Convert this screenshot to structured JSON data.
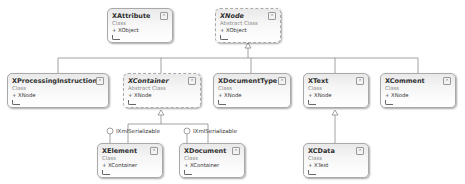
{
  "diagram": {
    "type": "class-diagram",
    "classes": [
      {
        "id": "xattribute",
        "name": "XAttribute",
        "kind": "Class",
        "base": "+ XObject",
        "abstract": false
      },
      {
        "id": "xnode",
        "name": "XNode",
        "kind": "Abstract Class",
        "base": "+ XObject",
        "abstract": true
      },
      {
        "id": "xprocessinginstruction",
        "name": "XProcessingInstruction",
        "kind": "Class",
        "base": "+ XNode",
        "abstract": false
      },
      {
        "id": "xcontainer",
        "name": "XContainer",
        "kind": "Abstract Class",
        "base": "+ XNode",
        "abstract": true
      },
      {
        "id": "xdocumenttype",
        "name": "XDocumentType",
        "kind": "Class",
        "base": "+ XNode",
        "abstract": false
      },
      {
        "id": "xtext",
        "name": "XText",
        "kind": "Class",
        "base": "+ XNode",
        "abstract": false
      },
      {
        "id": "xcomment",
        "name": "XComment",
        "kind": "Class",
        "base": "+ XNode",
        "abstract": false
      },
      {
        "id": "xelement",
        "name": "XElement",
        "kind": "Class",
        "base": "+ XContainer",
        "abstract": false
      },
      {
        "id": "xdocument",
        "name": "XDocument",
        "kind": "Class",
        "base": "+ XContainer",
        "abstract": false
      },
      {
        "id": "xcdata",
        "name": "XCData",
        "kind": "Class",
        "base": "+ XText",
        "abstract": false
      }
    ],
    "interfaces": [
      {
        "owner": "xelement",
        "label": "IXmlSerializable"
      },
      {
        "owner": "xdocument",
        "label": "IXmlSerializable"
      }
    ],
    "collapse_glyph": "⌃",
    "inheritance": [
      {
        "child": "xprocessinginstruction",
        "parent": "xnode"
      },
      {
        "child": "xcontainer",
        "parent": "xnode"
      },
      {
        "child": "xdocumenttype",
        "parent": "xnode"
      },
      {
        "child": "xtext",
        "parent": "xnode"
      },
      {
        "child": "xcomment",
        "parent": "xnode"
      },
      {
        "child": "xelement",
        "parent": "xcontainer"
      },
      {
        "child": "xdocument",
        "parent": "xcontainer"
      },
      {
        "child": "xcdata",
        "parent": "xtext"
      }
    ]
  }
}
